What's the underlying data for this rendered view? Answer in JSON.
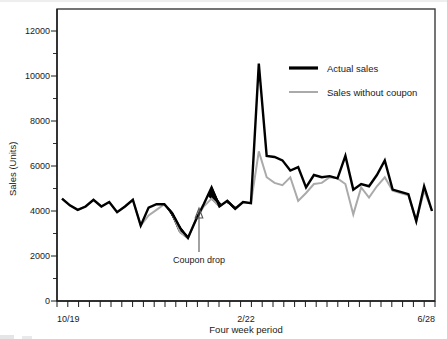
{
  "chart_data": {
    "type": "line",
    "title": "",
    "xlabel": "Four week period",
    "ylabel": "Sales (Units)",
    "ylim": [
      0,
      12600
    ],
    "ytick_labels": [
      "0",
      "2000",
      "4000",
      "6000",
      "8000",
      "10000",
      "12000"
    ],
    "ytick_values": [
      0,
      2000,
      4000,
      6000,
      8000,
      10000,
      12000
    ],
    "yminor_values": [
      1000,
      3000,
      5000,
      7000,
      9000,
      11000
    ],
    "xtick_labels": [
      "10/19",
      "2/22",
      "6/28"
    ],
    "xtick_indices": [
      0,
      18,
      35
    ],
    "x_tick_count": 36,
    "grid": false,
    "legend_position": "top-right",
    "annotations": [
      {
        "label": "Coupon drop",
        "x_index": 13,
        "y_value": 4400,
        "arrow": true
      }
    ],
    "shaded_region": {
      "label": "incremental sales (hatched)",
      "pattern": "diagonal-hatch",
      "from_index": 13,
      "to_index": 22,
      "color": "#000000"
    },
    "series": [
      {
        "name": "Actual sales",
        "color": "#000000",
        "values": [
          4550,
          4250,
          4050,
          4200,
          4500,
          4200,
          4400,
          3950,
          4200,
          4500,
          3350,
          4150,
          4300,
          4300,
          3900,
          3250,
          2800,
          3600,
          4300,
          5050,
          4200,
          4450,
          4100,
          4400,
          4350,
          10550,
          6450,
          6400,
          6250,
          5800,
          5950,
          5050,
          5600,
          5500,
          5550,
          5450,
          6450,
          4950,
          5200,
          5100,
          5600,
          6250,
          4950,
          4850,
          4750,
          3550,
          5100,
          4000
        ]
      },
      {
        "name": "Sales without coupon",
        "color": "#aaaaaa",
        "values": [
          4550,
          4250,
          4050,
          4200,
          4500,
          4200,
          4400,
          3950,
          4200,
          4500,
          3350,
          3800,
          4050,
          4300,
          3900,
          3050,
          2800,
          3600,
          4200,
          4550,
          4200,
          4450,
          4100,
          4400,
          4350,
          6650,
          5500,
          5250,
          5150,
          5500,
          4450,
          4800,
          5200,
          5250,
          5500,
          5450,
          5200,
          3850,
          5050,
          4600,
          5100,
          5500,
          4900,
          4800,
          4700,
          3550,
          4900,
          4000
        ]
      }
    ]
  },
  "axis": {
    "x_title": "Four week period",
    "y_title": "Sales (Units)",
    "x_tick_start": "10/19",
    "x_tick_mid": "2/22",
    "x_tick_end": "6/28",
    "y_ticks": {
      "t0": "0",
      "t1": "2000",
      "t2": "4000",
      "t3": "6000",
      "t4": "8000",
      "t5": "10000",
      "t6": "12000"
    }
  },
  "legend": {
    "items": [
      {
        "label": "Actual sales",
        "color": "#000000"
      },
      {
        "label": "Sales without coupon",
        "color": "#aaaaaa"
      }
    ]
  },
  "annotation": {
    "coupon_drop_label": "Coupon drop"
  },
  "colors": {
    "actual": "#000000",
    "baseline": "#aaaaaa",
    "frame": "#3b3b3b",
    "background": "#ffffff"
  }
}
